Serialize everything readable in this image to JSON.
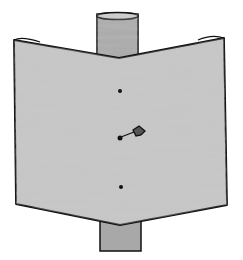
{
  "illustration": {
    "subject": "paper sheet pinned around a wooden post",
    "colors": {
      "background": "#ffffff",
      "paper": "#c9c9c9",
      "post": "#a6a6a6",
      "outline": "#111111"
    },
    "elements": [
      "post",
      "bent-paper-sheet",
      "upper-hole",
      "thumbtack",
      "lower-hole"
    ]
  }
}
